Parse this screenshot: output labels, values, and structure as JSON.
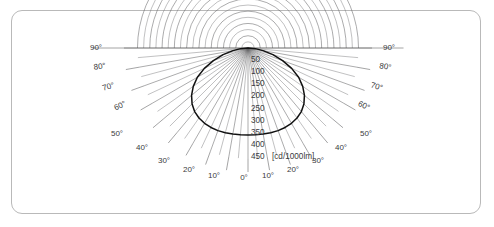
{
  "card": {
    "border_color": "#b9b9b9"
  },
  "chart_data": {
    "type": "line",
    "subtype": "polar-luminous-intensity-distribution",
    "title": "",
    "unit_label": "[cd/1000lm]",
    "center": {
      "x": 248,
      "y": 48
    },
    "radial_axis": {
      "label": "[cd/1000lm]",
      "min": 0,
      "max": 450,
      "ring_step": 25,
      "label_step": 50,
      "pixels_per_unit": 0.2456,
      "tick_labels": [
        "50",
        "100",
        "150",
        "200",
        "250",
        "300",
        "350",
        "400",
        "450"
      ],
      "tick_values": [
        50,
        100,
        150,
        200,
        250,
        300,
        350,
        400,
        450
      ]
    },
    "angular_axis": {
      "unit": "degrees",
      "min": -90,
      "max": 90,
      "grid_step": 5,
      "label_step": 10,
      "left_labels": [
        "90°",
        "80°",
        "70°",
        "60°",
        "50°",
        "40°",
        "30°",
        "20°",
        "10°"
      ],
      "right_labels": [
        "10°",
        "20°",
        "30°",
        "40°",
        "50°",
        "60°",
        "70°",
        "80°",
        "90°"
      ],
      "center_label": "0°",
      "labeled_left_upper": [
        "90°",
        "80°",
        "70°",
        "60°"
      ],
      "labeled_left_lower": [
        "50°",
        "40°",
        "30°",
        "20°",
        "10°"
      ],
      "labeled_right_upper": [
        "90°",
        "80°",
        "70°",
        "60°"
      ],
      "labeled_right_lower": [
        "50°",
        "40°",
        "30°",
        "20°",
        "10°"
      ]
    },
    "grid": true,
    "legend": "none",
    "series": [
      {
        "name": "Luminous intensity",
        "angles": [
          -90,
          -85,
          -80,
          -75,
          -70,
          -65,
          -60,
          -55,
          -50,
          -45,
          -40,
          -35,
          -30,
          -25,
          -20,
          -15,
          -10,
          -5,
          0,
          5,
          10,
          15,
          20,
          25,
          30,
          35,
          40,
          45,
          50,
          55,
          60,
          65,
          70,
          75,
          80,
          85,
          90
        ],
        "values": [
          0,
          30,
          62,
          105,
          150,
          196,
          238,
          272,
          300,
          322,
          338,
          348,
          354,
          357,
          358,
          357,
          356,
          355,
          354,
          355,
          356,
          357,
          358,
          357,
          354,
          348,
          338,
          322,
          300,
          272,
          238,
          196,
          150,
          105,
          62,
          30,
          0
        ]
      }
    ]
  },
  "labels": {
    "radial": [
      {
        "text": "50",
        "x": 251,
        "y": 62
      },
      {
        "text": "100",
        "x": 251,
        "y": 74
      },
      {
        "text": "150",
        "x": 251,
        "y": 86
      },
      {
        "text": "200",
        "x": 251,
        "y": 98
      },
      {
        "text": "250",
        "x": 251,
        "y": 111
      },
      {
        "text": "300",
        "x": 251,
        "y": 123
      },
      {
        "text": "350",
        "x": 251,
        "y": 135
      },
      {
        "text": "400",
        "x": 251,
        "y": 147
      },
      {
        "text": "450",
        "x": 251,
        "y": 159
      }
    ],
    "unit": {
      "text": "[cd/1000lm]",
      "x": 272,
      "y": 159
    },
    "angles": [
      {
        "text": "90°",
        "x": 96,
        "y": 50,
        "rot": 0
      },
      {
        "text": "80°",
        "x": 100,
        "y": 69,
        "rot": -8
      },
      {
        "text": "70°",
        "x": 109,
        "y": 89,
        "rot": -16
      },
      {
        "text": "60°",
        "x": 121,
        "y": 108,
        "rot": -24
      },
      {
        "text": "50°",
        "x": 117,
        "y": 136,
        "rot": 0
      },
      {
        "text": "40°",
        "x": 142,
        "y": 150,
        "rot": 0
      },
      {
        "text": "30°",
        "x": 164,
        "y": 163,
        "rot": 0
      },
      {
        "text": "20°",
        "x": 189,
        "y": 172,
        "rot": 0
      },
      {
        "text": "10°",
        "x": 214,
        "y": 178,
        "rot": 0
      },
      {
        "text": "0°",
        "x": 244,
        "y": 180,
        "rot": 0
      },
      {
        "text": "10°",
        "x": 268,
        "y": 178,
        "rot": 0
      },
      {
        "text": "20°",
        "x": 293,
        "y": 172,
        "rot": 0
      },
      {
        "text": "30°",
        "x": 318,
        "y": 163,
        "rot": 0
      },
      {
        "text": "40°",
        "x": 341,
        "y": 150,
        "rot": 0
      },
      {
        "text": "50°",
        "x": 366,
        "y": 136,
        "rot": 0
      },
      {
        "text": "60°",
        "x": 363,
        "y": 108,
        "rot": 24
      },
      {
        "text": "70°",
        "x": 376,
        "y": 89,
        "rot": 16
      },
      {
        "text": "80°",
        "x": 385,
        "y": 69,
        "rot": 8
      },
      {
        "text": "90°",
        "x": 389,
        "y": 50,
        "rot": 0
      }
    ]
  }
}
